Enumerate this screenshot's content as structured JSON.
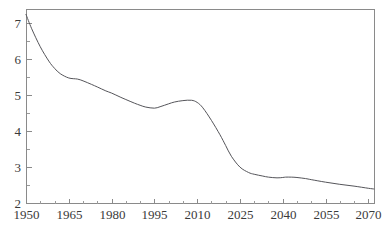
{
  "chart_data": {
    "type": "line",
    "title": "",
    "subtitle": "",
    "xlabel": "",
    "ylabel": "",
    "xlim": [
      1950,
      2072
    ],
    "ylim": [
      2,
      7.4
    ],
    "grid": false,
    "legend": "none",
    "x_ticks": [
      1950,
      1965,
      1980,
      1995,
      2010,
      2025,
      2040,
      2055,
      2070
    ],
    "x_tick_labels": [
      "1950",
      "1965",
      "1980",
      "1995",
      "2010",
      "2025",
      "2040",
      "2055",
      "2070"
    ],
    "x_minor_step": 5,
    "y_ticks": [
      2,
      3,
      4,
      5,
      6,
      7
    ],
    "y_tick_labels": [
      "2",
      "3",
      "4",
      "5",
      "6",
      "7"
    ],
    "y_minor_step": 0.5,
    "series": [
      {
        "name": "series-1",
        "color": "#55555a",
        "x": [
          1950,
          1952,
          1955,
          1958,
          1960,
          1962,
          1965,
          1968,
          1970,
          1973,
          1975,
          1978,
          1980,
          1983,
          1985,
          1988,
          1990,
          1992,
          1995,
          1997,
          2000,
          2002,
          2005,
          2008,
          2010,
          2012,
          2015,
          2018,
          2020,
          2022,
          2025,
          2028,
          2030,
          2033,
          2035,
          2038,
          2040,
          2041,
          2043,
          2045,
          2048,
          2050,
          2055,
          2060,
          2065,
          2070,
          2072
        ],
        "values": [
          7.25,
          6.85,
          6.35,
          5.95,
          5.75,
          5.6,
          5.48,
          5.45,
          5.4,
          5.3,
          5.23,
          5.12,
          5.06,
          4.95,
          4.88,
          4.78,
          4.72,
          4.67,
          4.64,
          4.68,
          4.76,
          4.81,
          4.85,
          4.86,
          4.8,
          4.65,
          4.3,
          3.9,
          3.6,
          3.3,
          3.0,
          2.85,
          2.8,
          2.75,
          2.72,
          2.7,
          2.71,
          2.72,
          2.72,
          2.71,
          2.68,
          2.65,
          2.58,
          2.52,
          2.47,
          2.41,
          2.39
        ]
      }
    ]
  },
  "plot_area": {
    "left": 26,
    "right": 374,
    "top": 9,
    "bottom": 203
  }
}
